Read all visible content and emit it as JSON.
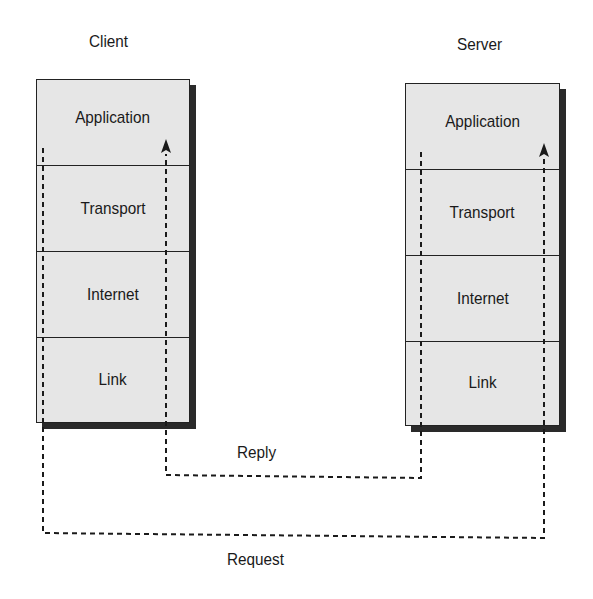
{
  "diagram": {
    "client": {
      "title": "Client",
      "layers": [
        {
          "label": "Application"
        },
        {
          "label": "Transport"
        },
        {
          "label": "Internet"
        },
        {
          "label": "Link"
        }
      ]
    },
    "server": {
      "title": "Server",
      "layers": [
        {
          "label": "Application"
        },
        {
          "label": "Transport"
        },
        {
          "label": "Internet"
        },
        {
          "label": "Link"
        }
      ]
    },
    "flows": {
      "reply": {
        "label": "Reply",
        "from": "Server Application",
        "to": "Client Application",
        "style": "dashed",
        "arrow": "up-into-client"
      },
      "request": {
        "label": "Request",
        "from": "Client Application",
        "to": "Server Application",
        "style": "dashed",
        "arrow": "up-into-server"
      }
    },
    "colors": {
      "layer_fill": "#e6e6e6",
      "border": "#222222",
      "shadow": "#2a2a2a",
      "line": "#1a1a1a"
    }
  }
}
